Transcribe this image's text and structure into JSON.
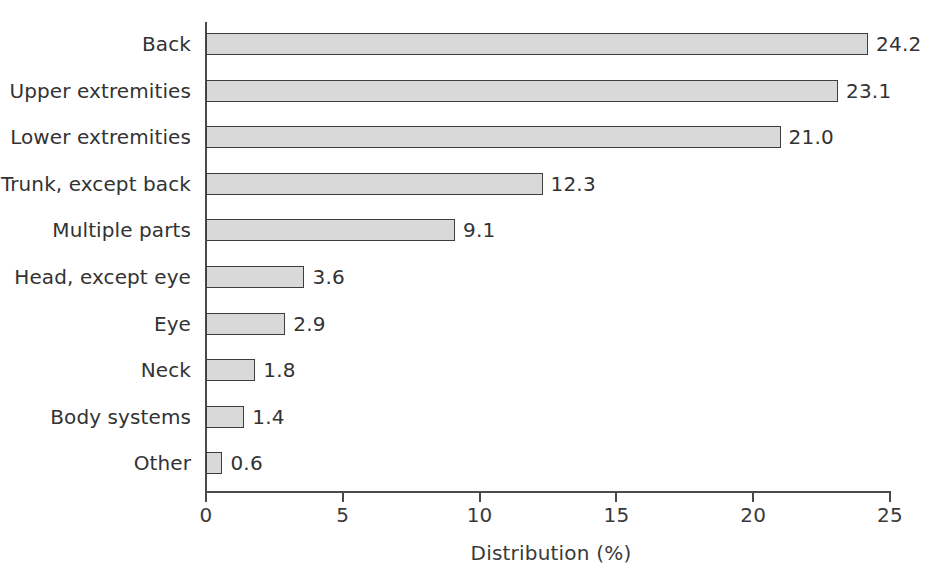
{
  "chart_data": {
    "type": "bar",
    "orientation": "horizontal",
    "title": "",
    "xlabel": "Distribution (%)",
    "ylabel": "",
    "xlim": [
      0,
      25
    ],
    "xticks": [
      0,
      5,
      10,
      15,
      20,
      25
    ],
    "xtick_labels": [
      "0",
      "5",
      "10",
      "15",
      "20",
      "25"
    ],
    "grid": false,
    "legend": false,
    "value_label_format": "one-decimal",
    "categories": [
      "Back",
      "Upper extremities",
      "Lower extremities",
      "Trunk, except back",
      "Multiple parts",
      "Head, except eye",
      "Eye",
      "Neck",
      "Body systems",
      "Other"
    ],
    "values": [
      24.2,
      23.1,
      21.0,
      12.3,
      9.1,
      3.6,
      2.9,
      1.8,
      1.4,
      0.6
    ],
    "value_labels": [
      "24.2",
      "23.1",
      "21.0",
      "12.3",
      "9.1",
      "3.6",
      "2.9",
      "1.8",
      "1.4",
      "0.6"
    ],
    "bar_fill_color": "#d9d9d9",
    "bar_border_color": "#3d3d3d",
    "axis_color": "#4a4a4a",
    "text_color": "#333333",
    "background_color": "#ffffff"
  }
}
